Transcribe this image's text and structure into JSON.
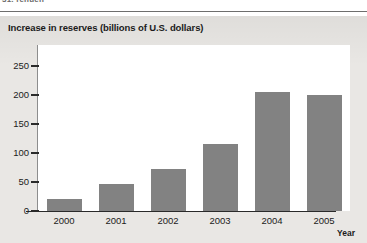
{
  "page": {
    "header_text": "31. renuen"
  },
  "figure": {
    "title": "Increase in reserves (billions of U.S. dollars)",
    "x_axis_title": "Year"
  },
  "colors": {
    "bar": "#828282",
    "panel_background": "#e9e7e4",
    "plot_background": "#ffffff",
    "axis": "#2a2a2a",
    "text": "#1b1b1b"
  },
  "chart_data": {
    "type": "bar",
    "title": "Increase in reserves (billions of U.S. dollars)",
    "xlabel": "Year",
    "ylabel": "",
    "categories": [
      "2000",
      "2001",
      "2002",
      "2003",
      "2004",
      "2005"
    ],
    "values": [
      20,
      47,
      72,
      115,
      205,
      200
    ],
    "ylim": [
      0,
      250
    ],
    "yticks": [
      0,
      50,
      100,
      150,
      200,
      250
    ],
    "ytick_labels": [
      "0",
      "50",
      "100",
      "150",
      "200",
      "250"
    ],
    "grid": false,
    "legend": null
  }
}
